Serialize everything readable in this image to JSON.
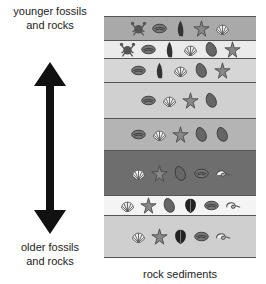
{
  "labels": {
    "top": "younger fossils and rocks",
    "top_line1": "younger fossils",
    "top_line2": "and rocks",
    "bottom_line1": "older fossils",
    "bottom_line2": "and rocks",
    "caption": "rock sediments"
  },
  "layers": [
    {
      "color": "#a9a9a9",
      "top": 16,
      "height": 24,
      "fossils": [
        "crab",
        "clam",
        "snail",
        "starfish",
        "scallop"
      ]
    },
    {
      "color": "#ebebeb",
      "top": 40,
      "height": 18,
      "fossils": [
        "crab",
        "clam",
        "snail",
        "scallop",
        "mussel",
        "starfish"
      ]
    },
    {
      "color": "#d6d6d6",
      "top": 58,
      "height": 24,
      "fossils": [
        "clam",
        "snail",
        "scallop",
        "mussel",
        "starfish"
      ]
    },
    {
      "color": "#d0d0d0",
      "top": 82,
      "height": 36,
      "fossils": [
        "clam",
        "scallop",
        "starfish",
        "mussel"
      ]
    },
    {
      "color": "#b4b4b4",
      "top": 118,
      "height": 32,
      "fossils": [
        "clam",
        "scallop",
        "starfish",
        "mussel",
        "mussel"
      ]
    },
    {
      "color": "#6e6e6e",
      "top": 150,
      "height": 45,
      "fossils": [
        "scallop",
        "starfish",
        "mussel",
        "clam",
        "ammonite"
      ]
    },
    {
      "color": "#f4f4f4",
      "top": 195,
      "height": 20,
      "fossils": [
        "scallop",
        "starfish",
        "mussel",
        "trilobite",
        "clam",
        "ammonite"
      ]
    },
    {
      "color": "#cfcfcf",
      "top": 215,
      "height": 43,
      "fossils": [
        "scallop",
        "starfish",
        "trilobite",
        "clam",
        "ammonite"
      ]
    }
  ]
}
